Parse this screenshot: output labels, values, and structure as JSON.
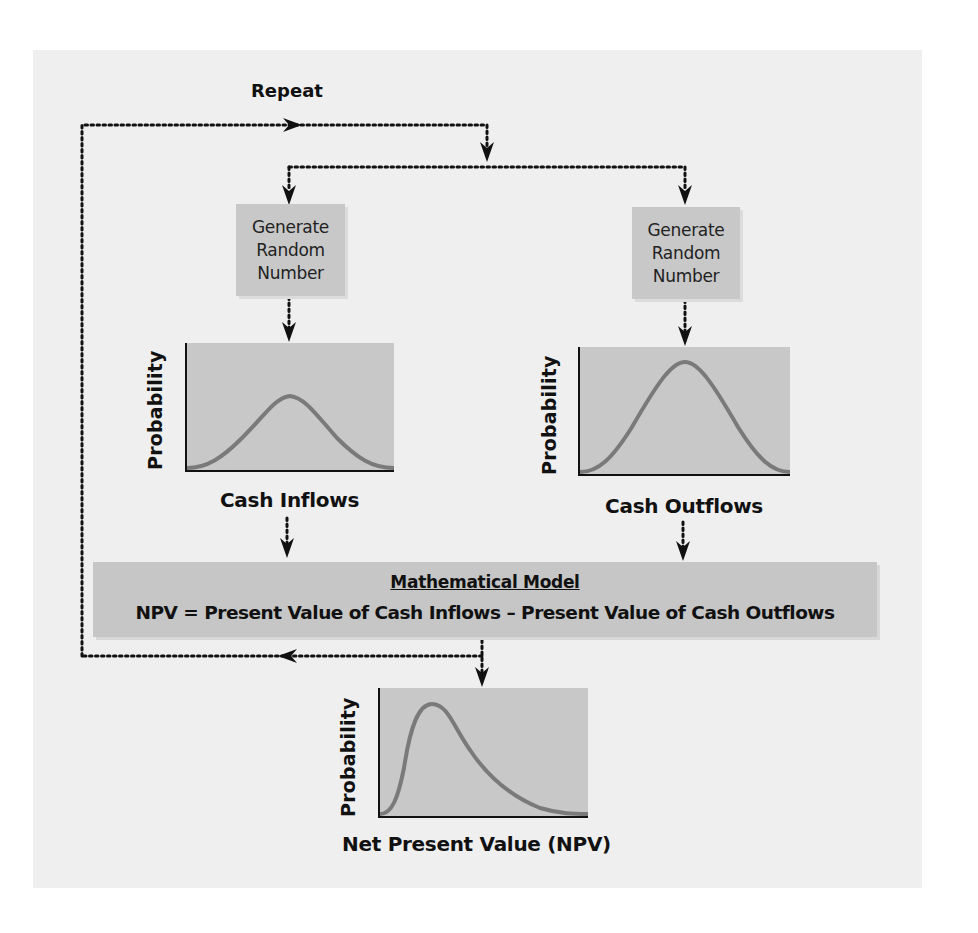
{
  "diagram": {
    "repeat_label": "Repeat",
    "generators": [
      {
        "line1": "Generate",
        "line2": "Random",
        "line3": "Number"
      },
      {
        "line1": "Generate",
        "line2": "Random",
        "line3": "Number"
      }
    ],
    "charts": [
      {
        "ylabel": "Probability",
        "xlabel": "Cash Inflows",
        "shape": "normal-wide-low"
      },
      {
        "ylabel": "Probability",
        "xlabel": "Cash Outflows",
        "shape": "normal-tall"
      },
      {
        "ylabel": "Probability",
        "xlabel": "Net Present Value (NPV)",
        "shape": "right-skewed"
      }
    ],
    "model": {
      "heading": "Mathematical Model",
      "formula": "NPV = Present Value of Cash Inflows – Present Value of Cash Outflows"
    },
    "colors": {
      "panel": "#efefef",
      "box": "#c8c8c8",
      "curve": "#7a7a7a",
      "line": "#111111"
    }
  }
}
